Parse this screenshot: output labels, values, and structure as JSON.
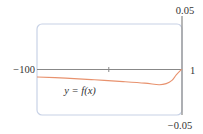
{
  "chart_data": {
    "type": "line",
    "title": "",
    "xlabel": "",
    "ylabel": "",
    "xlim": [
      -100,
      1
    ],
    "ylim": [
      -0.05,
      0.05
    ],
    "grid": false,
    "tick_labels": {
      "x_min": "−100",
      "x_max": "1",
      "y_max": "0.05",
      "y_min": "−0.05"
    },
    "x_ticks": [
      -50
    ],
    "series": [
      {
        "name": "y = f(x)",
        "color": "#e8926e",
        "x": [
          -100,
          -80,
          -60,
          -40,
          -25,
          -15,
          -10,
          -6,
          -3,
          0,
          1
        ],
        "y": [
          -0.0082,
          -0.0095,
          -0.0113,
          -0.0133,
          -0.015,
          -0.0167,
          -0.0155,
          -0.012,
          -0.006,
          -0.001,
          0
        ]
      }
    ],
    "annotations": [
      {
        "text": "y = f(x)",
        "x": -70,
        "y": -0.022
      }
    ],
    "colors": {
      "frame": "#c8d2e6",
      "axis": "#888888",
      "curve": "#e8926e",
      "text": "#333333"
    }
  }
}
